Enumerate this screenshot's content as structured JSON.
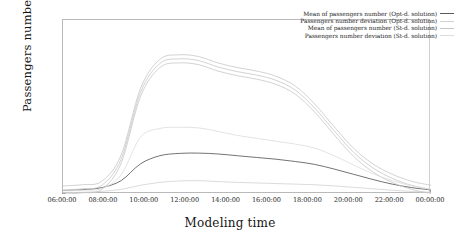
{
  "chart_data": {
    "type": "line",
    "title": "",
    "xlabel": "Modeling time",
    "ylabel": "Passengers number",
    "xlim": [
      "06:00:00",
      "00:00:00"
    ],
    "ylim": [
      0,
      3000
    ],
    "grid": false,
    "legend_position": "top-right",
    "xticks": [
      "06:00:00",
      "08:00:00",
      "10:00:00",
      "12:00:00",
      "14:00:00",
      "16:00:00",
      "18:00:00",
      "20:00:00",
      "22:00:00",
      "00:00:00"
    ],
    "yticks": [
      "0",
      "500",
      "1000",
      "1500",
      "2000",
      "2500",
      "3000"
    ],
    "x": [
      "06:00:00",
      "07:00:00",
      "08:00:00",
      "09:00:00",
      "10:00:00",
      "11:00:00",
      "11:30:00",
      "12:00:00",
      "13:00:00",
      "14:00:00",
      "15:00:00",
      "16:00:00",
      "17:00:00",
      "18:00:00",
      "19:00:00",
      "20:00:00",
      "21:00:00",
      "22:00:00",
      "23:00:00",
      "00:00:00"
    ],
    "series": [
      {
        "name": "Mean of passengers number (Opt-d. solution)",
        "color": "#5a5a5a",
        "values": [
          60,
          75,
          110,
          230,
          520,
          660,
          700,
          705,
          690,
          660,
          630,
          600,
          560,
          510,
          430,
          340,
          250,
          170,
          110,
          70
        ]
      },
      {
        "name": "Passengers number deviation (Opt-d. solution)",
        "color": "#d2d2d2",
        "values": [
          25,
          30,
          45,
          80,
          150,
          200,
          225,
          230,
          215,
          200,
          190,
          180,
          170,
          160,
          140,
          115,
          90,
          65,
          45,
          30
        ]
      },
      {
        "name": "Mean of passengers number (St-d. solution)",
        "color": "#c6c6c6",
        "values": [
          70,
          90,
          150,
          600,
          1750,
          2250,
          2330,
          2300,
          2190,
          2110,
          2050,
          1960,
          1790,
          1480,
          1090,
          720,
          450,
          270,
          150,
          80
        ]
      },
      {
        "name": "Passengers number deviation (St-d. solution)",
        "color": "#dcdcdc",
        "values": [
          55,
          65,
          95,
          330,
          980,
          1130,
          1150,
          1140,
          1080,
          1010,
          960,
          910,
          860,
          790,
          660,
          500,
          350,
          230,
          140,
          80
        ]
      }
    ],
    "band_offsets": [
      -70,
      0,
      70
    ]
  },
  "legend": {
    "entries": [
      {
        "label": "Mean of passengers number (Opt-d. solution)",
        "color": "#5a5a5a"
      },
      {
        "label": "Passengers number deviation (Opt-d. solution)",
        "color": "#d2d2d2"
      },
      {
        "label": "Mean of passengers number (St-d. solution)",
        "color": "#c6c6c6"
      },
      {
        "label": "Passengers number deviation (St-d. solution)",
        "color": "#dcdcdc"
      }
    ]
  }
}
